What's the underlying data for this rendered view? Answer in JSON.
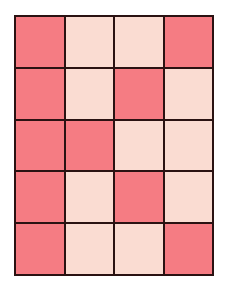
{
  "grid": {
    "rows": 5,
    "cols": 4,
    "colors": {
      "dark": "#f57c83",
      "light": "#fadcd2",
      "border": "#2a1212"
    },
    "cells": [
      [
        "dark",
        "light",
        "light",
        "dark"
      ],
      [
        "dark",
        "light",
        "dark",
        "light"
      ],
      [
        "dark",
        "dark",
        "light",
        "light"
      ],
      [
        "dark",
        "light",
        "dark",
        "light"
      ],
      [
        "dark",
        "light",
        "light",
        "dark"
      ]
    ]
  }
}
